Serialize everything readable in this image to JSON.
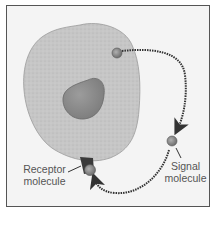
{
  "diagram": {
    "type": "cell-signaling (autocrine)",
    "labels": {
      "receptor": [
        "Receptor",
        "molecule"
      ],
      "signal": [
        "Signal",
        "molecule"
      ]
    },
    "colors": {
      "background": "#f4f4f4",
      "frame": "#555555",
      "cell": "#c4c4c4",
      "nucleus": "#8e8e8e",
      "molecule": "#8a8a8a",
      "receptor": "#3a3a3a",
      "arrow": "#333333"
    }
  }
}
